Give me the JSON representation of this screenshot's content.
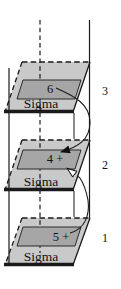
{
  "figure": {
    "layers": [
      {
        "layer_number": "3",
        "plane_label": "Sigma",
        "value": "6"
      },
      {
        "layer_number": "2",
        "plane_label": "Sigma",
        "value": "4 +"
      },
      {
        "layer_number": "1",
        "plane_label": "Sigma",
        "value": "5 +"
      }
    ],
    "arrows": [
      {
        "name": "arrow-layer3-to-layer2",
        "from": "6 (layer 3)",
        "to": "4 + (layer 2)",
        "head": "filled"
      },
      {
        "name": "arrow-layer1-to-layer2",
        "from": "5 + (layer 1)",
        "to": "layer 2 inner box",
        "head": "open",
        "hidden_segment": "dashed"
      }
    ],
    "colors": {
      "plane_fill": "#c9c9c9",
      "inner_fill": "#a6a6a6",
      "line": "#1a1a1a",
      "background": "#ffffff"
    }
  }
}
